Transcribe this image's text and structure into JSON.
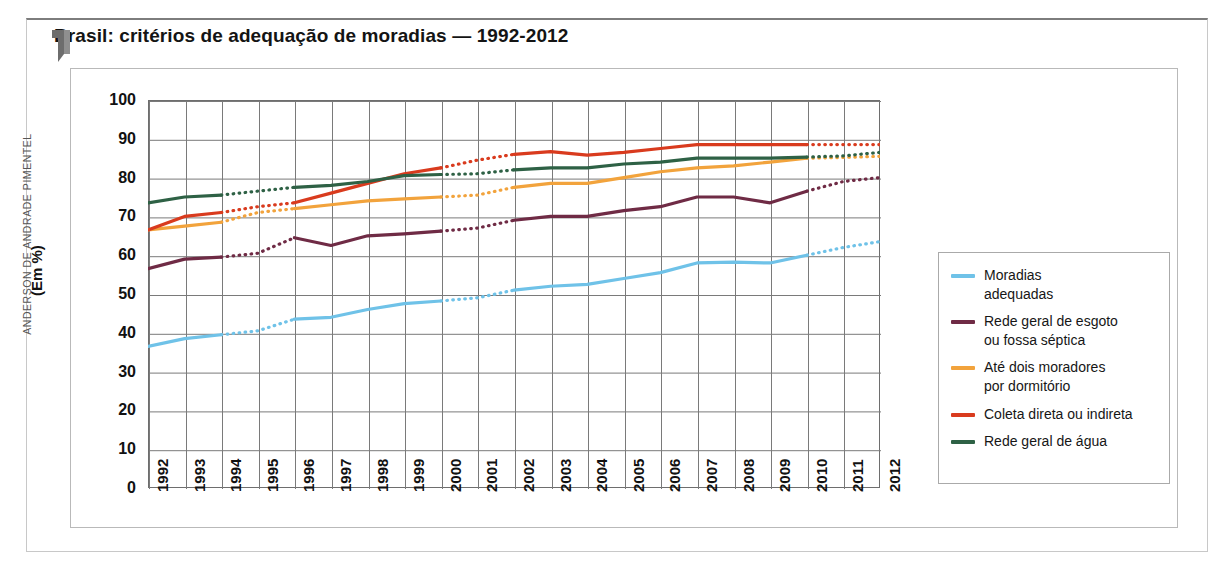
{
  "title": "Brasil: critérios de adequação de moradias — 1992-2012",
  "credit": "ANDERSON DE ANDRADE PIMENTEL",
  "icons": {
    "flag": "flag-bookmark-icon"
  },
  "chart_data": {
    "type": "line",
    "title": "Brasil: critérios de adequação de moradias — 1992-2012",
    "xlabel": "",
    "ylabel": "(Em %)",
    "ylim": [
      0,
      100
    ],
    "ytick_step": 10,
    "yticks": [
      "100",
      "90",
      "80",
      "70",
      "60",
      "50",
      "40",
      "30",
      "20",
      "10",
      "0"
    ],
    "grid": true,
    "legend_position": "right",
    "categories": [
      "1992",
      "1993",
      "1994",
      "1995",
      "1996",
      "1997",
      "1998",
      "1999",
      "2000",
      "2001",
      "2002",
      "2003",
      "2004",
      "2005",
      "2006",
      "2007",
      "2008",
      "2009",
      "2010",
      "2011",
      "2012"
    ],
    "series": [
      {
        "name": "Moradias adequadas",
        "color": "#6FC2E8",
        "values": [
          36.5,
          38.5,
          39.5,
          40.5,
          43.5,
          44.0,
          46.0,
          47.5,
          48.2,
          49.0,
          51.0,
          52.0,
          52.5,
          54.0,
          55.5,
          58.0,
          58.2,
          58.0,
          60.0,
          62.0,
          63.5
        ],
        "dashed_segments": [
          [
            1993,
            1995
          ],
          [
            1999,
            2001
          ],
          [
            2009,
            2011
          ]
        ]
      },
      {
        "name": "Rede geral de esgoto ou fossa séptica",
        "color": "#6F2B45",
        "values": [
          56.5,
          59.0,
          59.5,
          60.5,
          64.5,
          62.5,
          65.0,
          65.5,
          66.2,
          67.0,
          69.0,
          70.0,
          70.0,
          71.5,
          72.5,
          75.0,
          75.0,
          73.5,
          76.5,
          79.0,
          80.0
        ],
        "dashed_segments": [
          [
            1993,
            1995
          ],
          [
            1999,
            2001
          ],
          [
            2009,
            2011
          ]
        ]
      },
      {
        "name": "Até dois moradores por dormitório",
        "color": "#F2A33C",
        "values": [
          66.5,
          67.5,
          68.5,
          71.0,
          72.0,
          73.0,
          74.0,
          74.5,
          75.0,
          75.5,
          77.5,
          78.5,
          78.5,
          80.0,
          81.5,
          82.5,
          83.0,
          84.0,
          85.0,
          85.2,
          85.5
        ],
        "dashed_segments": [
          [
            1993,
            1995
          ],
          [
            1999,
            2001
          ],
          [
            2009,
            2011
          ]
        ]
      },
      {
        "name": "Coleta direta ou indireta",
        "color": "#D93B1E",
        "values": [
          66.5,
          70.0,
          71.0,
          72.5,
          73.5,
          76.0,
          78.5,
          81.0,
          82.5,
          84.5,
          86.0,
          86.7,
          85.8,
          86.5,
          87.5,
          88.5,
          88.5,
          88.5,
          88.5,
          88.5,
          88.5
        ],
        "dashed_segments": [
          [
            1993,
            1995
          ],
          [
            1999,
            2001
          ],
          [
            2009,
            2011
          ]
        ]
      },
      {
        "name": "Rede geral de água",
        "color": "#2E6145",
        "values": [
          73.5,
          75.0,
          75.5,
          76.5,
          77.5,
          78.0,
          79.0,
          80.5,
          80.8,
          81.0,
          82.0,
          82.5,
          82.5,
          83.5,
          84.0,
          85.0,
          85.0,
          85.0,
          85.3,
          85.6,
          86.5
        ],
        "dashed_segments": [
          [
            1993,
            1995
          ],
          [
            1999,
            2001
          ],
          [
            2009,
            2011
          ]
        ]
      }
    ]
  },
  "legend": {
    "items": [
      {
        "label": "Moradias\nadequadas",
        "line1": "Moradias",
        "line2": "adequadas",
        "color": "#6FC2E8"
      },
      {
        "label": "Rede geral de esgoto\nou fossa séptica",
        "line1": "Rede geral de esgoto",
        "line2": "ou fossa séptica",
        "color": "#6F2B45"
      },
      {
        "label": "Até dois moradores\npor dormitório",
        "line1": "Até dois moradores",
        "line2": "por dormitório",
        "color": "#F2A33C"
      },
      {
        "label": "Coleta direta ou indireta",
        "line1": "Coleta direta ou indireta",
        "line2": "",
        "color": "#D93B1E"
      },
      {
        "label": "Rede geral de água",
        "line1": "Rede geral de água",
        "line2": "",
        "color": "#2E6145"
      }
    ]
  }
}
